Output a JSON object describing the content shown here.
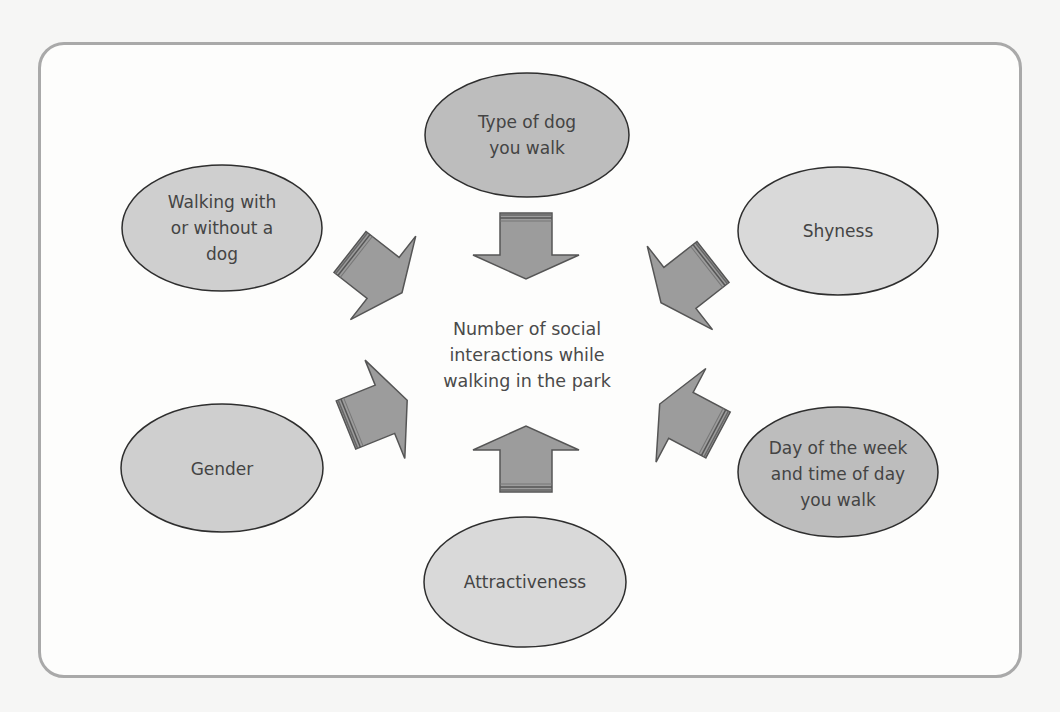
{
  "diagram": {
    "type": "influence-diagram",
    "center": {
      "label": "Number of social\ninteractions while\nwalking in the park"
    },
    "nodes": [
      {
        "id": "type-of-dog",
        "label": "Type of dog\nyou walk",
        "fill": "#bdbdbd"
      },
      {
        "id": "walking-with-dog",
        "label": "Walking with\nor without a\ndog",
        "fill": "#cfcfcf"
      },
      {
        "id": "shyness",
        "label": "Shyness",
        "fill": "#d9d9d9"
      },
      {
        "id": "gender",
        "label": "Gender",
        "fill": "#cfcfcf"
      },
      {
        "id": "attractiveness",
        "label": "Attractiveness",
        "fill": "#d9d9d9"
      },
      {
        "id": "day-time",
        "label": "Day of the week\nand time of day\nyou walk",
        "fill": "#bdbdbd"
      }
    ],
    "colors": {
      "frame_border": "#a9a9a9",
      "arrow_fill": "#9c9c9c",
      "arrow_stroke": "#555555",
      "ellipse_stroke": "#2e2e2e",
      "text": "#444444"
    }
  }
}
